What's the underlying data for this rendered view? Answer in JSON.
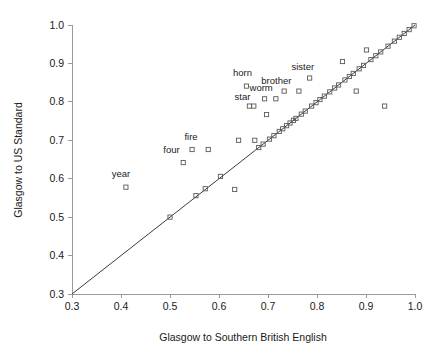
{
  "chart_data": {
    "type": "scatter",
    "title": "",
    "xlabel": "Glasgow to Southern British English",
    "ylabel": "Glasgow to US Standard",
    "xlim": [
      0.3,
      1.0
    ],
    "ylim": [
      0.3,
      1.0
    ],
    "xticks": [
      "0.3",
      "0.4",
      "0.5",
      "0.6",
      "0.7",
      "0.8",
      "0.9",
      "1.0"
    ],
    "yticks": [
      "0.3",
      "0.4",
      "0.5",
      "0.6",
      "0.7",
      "0.8",
      "0.9",
      "1.0"
    ],
    "grid": false,
    "legend": null,
    "marker": "open-square",
    "reference_line": {
      "type": "identity",
      "label": "y = x",
      "from": [
        0.3,
        0.3
      ],
      "to": [
        1.0,
        1.0
      ]
    },
    "points": [
      {
        "x": 0.41,
        "y": 0.578,
        "label": "year"
      },
      {
        "x": 0.5,
        "y": 0.5,
        "label": ""
      },
      {
        "x": 0.527,
        "y": 0.642,
        "label": "four"
      },
      {
        "x": 0.545,
        "y": 0.676,
        "label": "fire"
      },
      {
        "x": 0.553,
        "y": 0.556,
        "label": ""
      },
      {
        "x": 0.572,
        "y": 0.574,
        "label": ""
      },
      {
        "x": 0.578,
        "y": 0.676,
        "label": ""
      },
      {
        "x": 0.603,
        "y": 0.606,
        "label": ""
      },
      {
        "x": 0.632,
        "y": 0.572,
        "label": ""
      },
      {
        "x": 0.64,
        "y": 0.7,
        "label": ""
      },
      {
        "x": 0.656,
        "y": 0.841,
        "label": "horn"
      },
      {
        "x": 0.662,
        "y": 0.789,
        "label": "star"
      },
      {
        "x": 0.671,
        "y": 0.789,
        "label": ""
      },
      {
        "x": 0.673,
        "y": 0.7,
        "label": ""
      },
      {
        "x": 0.681,
        "y": 0.681,
        "label": ""
      },
      {
        "x": 0.69,
        "y": 0.69,
        "label": ""
      },
      {
        "x": 0.693,
        "y": 0.808,
        "label": "worm"
      },
      {
        "x": 0.697,
        "y": 0.767,
        "label": ""
      },
      {
        "x": 0.703,
        "y": 0.703,
        "label": ""
      },
      {
        "x": 0.712,
        "y": 0.712,
        "label": ""
      },
      {
        "x": 0.716,
        "y": 0.808,
        "label": ""
      },
      {
        "x": 0.723,
        "y": 0.723,
        "label": ""
      },
      {
        "x": 0.73,
        "y": 0.73,
        "label": ""
      },
      {
        "x": 0.733,
        "y": 0.828,
        "label": "brother"
      },
      {
        "x": 0.738,
        "y": 0.738,
        "label": ""
      },
      {
        "x": 0.745,
        "y": 0.745,
        "label": ""
      },
      {
        "x": 0.752,
        "y": 0.752,
        "label": ""
      },
      {
        "x": 0.757,
        "y": 0.757,
        "label": ""
      },
      {
        "x": 0.763,
        "y": 0.828,
        "label": ""
      },
      {
        "x": 0.768,
        "y": 0.768,
        "label": ""
      },
      {
        "x": 0.776,
        "y": 0.776,
        "label": ""
      },
      {
        "x": 0.785,
        "y": 0.862,
        "label": "sister"
      },
      {
        "x": 0.789,
        "y": 0.789,
        "label": ""
      },
      {
        "x": 0.798,
        "y": 0.798,
        "label": ""
      },
      {
        "x": 0.806,
        "y": 0.806,
        "label": ""
      },
      {
        "x": 0.815,
        "y": 0.815,
        "label": ""
      },
      {
        "x": 0.826,
        "y": 0.826,
        "label": ""
      },
      {
        "x": 0.836,
        "y": 0.836,
        "label": ""
      },
      {
        "x": 0.844,
        "y": 0.844,
        "label": ""
      },
      {
        "x": 0.852,
        "y": 0.905,
        "label": ""
      },
      {
        "x": 0.857,
        "y": 0.857,
        "label": ""
      },
      {
        "x": 0.866,
        "y": 0.866,
        "label": ""
      },
      {
        "x": 0.874,
        "y": 0.874,
        "label": ""
      },
      {
        "x": 0.88,
        "y": 0.828,
        "label": ""
      },
      {
        "x": 0.886,
        "y": 0.886,
        "label": ""
      },
      {
        "x": 0.895,
        "y": 0.895,
        "label": ""
      },
      {
        "x": 0.901,
        "y": 0.935,
        "label": ""
      },
      {
        "x": 0.91,
        "y": 0.91,
        "label": ""
      },
      {
        "x": 0.92,
        "y": 0.92,
        "label": ""
      },
      {
        "x": 0.93,
        "y": 0.93,
        "label": ""
      },
      {
        "x": 0.938,
        "y": 0.789,
        "label": ""
      },
      {
        "x": 0.945,
        "y": 0.945,
        "label": ""
      },
      {
        "x": 0.958,
        "y": 0.958,
        "label": ""
      },
      {
        "x": 0.968,
        "y": 0.968,
        "label": ""
      },
      {
        "x": 0.978,
        "y": 0.978,
        "label": ""
      },
      {
        "x": 0.988,
        "y": 0.988,
        "label": ""
      },
      {
        "x": 0.998,
        "y": 0.998,
        "label": ""
      }
    ],
    "annotations": [
      {
        "text": "year",
        "x": 0.4,
        "y": 0.605,
        "anchor": "middle"
      },
      {
        "text": "four",
        "x": 0.503,
        "y": 0.667,
        "anchor": "middle"
      },
      {
        "text": "fire",
        "x": 0.543,
        "y": 0.701,
        "anchor": "middle"
      },
      {
        "text": "horn",
        "x": 0.648,
        "y": 0.868,
        "anchor": "middle"
      },
      {
        "text": "star",
        "x": 0.648,
        "y": 0.806,
        "anchor": "middle"
      },
      {
        "text": "worm",
        "x": 0.686,
        "y": 0.827,
        "anchor": "middle"
      },
      {
        "text": "brother",
        "x": 0.717,
        "y": 0.847,
        "anchor": "middle"
      },
      {
        "text": "sister",
        "x": 0.771,
        "y": 0.882,
        "anchor": "middle"
      }
    ]
  }
}
